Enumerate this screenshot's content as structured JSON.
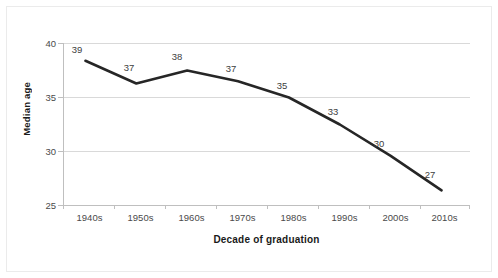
{
  "chart_data": {
    "type": "line",
    "title": "",
    "xlabel": "Decade of graduation",
    "ylabel": "Median age",
    "categories": [
      "1940s",
      "1950s",
      "1960s",
      "1970s",
      "1980s",
      "1990s",
      "2000s",
      "2010s"
    ],
    "values": [
      38.4,
      36.3,
      37.5,
      36.5,
      35.0,
      32.5,
      29.6,
      26.4
    ],
    "point_labels": [
      "39",
      "37",
      "38",
      "37",
      "35",
      "33",
      "30",
      "27"
    ],
    "series": [
      {
        "name": "Median age",
        "values": [
          38.4,
          36.3,
          37.5,
          36.5,
          35.0,
          32.5,
          29.6,
          26.4
        ]
      }
    ],
    "ylim": [
      25,
      40
    ],
    "yticks": [
      "40",
      "35",
      "30",
      "25"
    ],
    "ytick_values": [
      40,
      35,
      30,
      25
    ],
    "grid": true,
    "legend": "none",
    "line_color": "#262626",
    "grid_color": "#d9d9d9",
    "axis_color": "#bfbfbf",
    "background_color": "#ffffff"
  }
}
